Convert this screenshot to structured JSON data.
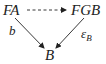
{
  "diagram": {
    "type": "commutative-triangle",
    "nodes": {
      "top_left": "FA",
      "top_right": "FGB",
      "bottom": "B"
    },
    "arrows": [
      {
        "from": "FA",
        "to": "FGB",
        "style": "dashed",
        "label": ""
      },
      {
        "from": "FA",
        "to": "B",
        "style": "solid",
        "label": "b"
      },
      {
        "from": "FGB",
        "to": "B",
        "style": "solid",
        "label": "ε",
        "label_sub": "B"
      }
    ],
    "colors": {
      "ink": "#222222",
      "background": "#ffffff"
    }
  }
}
